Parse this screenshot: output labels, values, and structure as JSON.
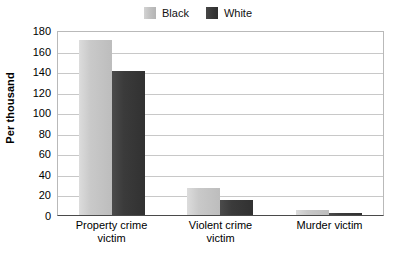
{
  "chart_data": {
    "type": "bar",
    "title": "",
    "subtitle": "",
    "xlabel": "",
    "ylabel": "Per thousand",
    "categories": [
      "Property crime\nvictim",
      "Violent crime\nvictim",
      "Murder victim"
    ],
    "series": [
      {
        "name": "Black",
        "color": "#c9c9c9",
        "values": [
          170,
          26,
          5
        ]
      },
      {
        "name": "White",
        "color": "#3b3b3b",
        "values": [
          140,
          15,
          2
        ]
      }
    ],
    "ylim": [
      0,
      180
    ],
    "yticks": [
      180,
      160,
      140,
      120,
      100,
      80,
      60,
      40,
      20,
      0
    ],
    "ytick_step": 20,
    "grid": true,
    "grid_axis": "y",
    "legend_position": "top-center",
    "background_color": "#ffffff",
    "gridline_color": "#c8c8c8",
    "axis_color": "#4a4a4a"
  },
  "legend": {
    "entries": [
      {
        "label": "Black"
      },
      {
        "label": "White"
      }
    ]
  }
}
